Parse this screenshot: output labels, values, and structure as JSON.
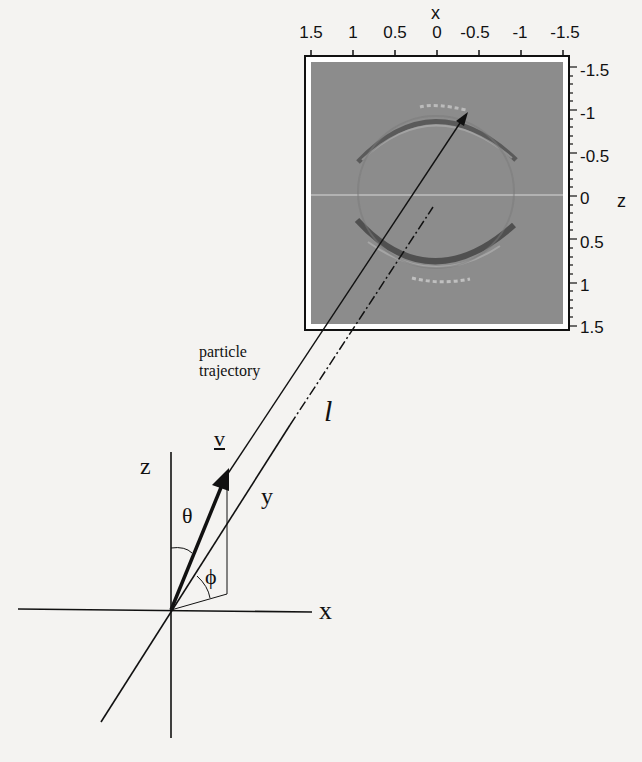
{
  "figure": {
    "image_plot": {
      "x_axis_label": "x",
      "z_axis_label": "z",
      "x_ticks": [
        "1.5",
        "1",
        "0.5",
        "0",
        "-0.5",
        "-1",
        "-1.5"
      ],
      "z_ticks": [
        "-1.5",
        "-1",
        "-0.5",
        "0",
        "0.5",
        "1",
        "1.5"
      ],
      "background_color": "#8a8a8a"
    },
    "trajectory_label_line1": "particle",
    "trajectory_label_line2": "trajectory",
    "distance_label": "l",
    "velocity_label": "v",
    "theta_label": "θ",
    "phi_label": "ϕ",
    "axis_labels": {
      "x": "x",
      "y": "y",
      "z": "z"
    }
  }
}
